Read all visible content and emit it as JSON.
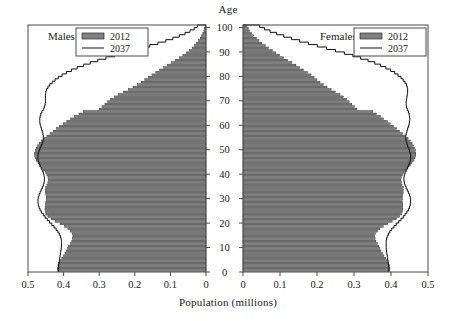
{
  "figure": {
    "age_axis_title": "Age",
    "x_axis_title": "Population (millions)",
    "background": "#ffffff",
    "frame_color": "#4a4a4a",
    "bar_fill": "#808080",
    "bar_edge": "#2b2b2b",
    "line_color": "#111111"
  },
  "panels": {
    "left": {
      "label": "Males",
      "legend": {
        "bar_label": "2012",
        "line_label": "2037"
      },
      "x_ticks": [
        "0.5",
        "0.4",
        "0.3",
        "0.2",
        "0.1",
        "0"
      ],
      "x_tick_values": [
        0.5,
        0.4,
        0.3,
        0.2,
        0.1,
        0.0
      ]
    },
    "right": {
      "label": "Females",
      "legend": {
        "bar_label": "2012",
        "line_label": "2037"
      },
      "x_ticks": [
        "0",
        "0.1",
        "0.2",
        "0.3",
        "0.4",
        "0.5"
      ],
      "x_tick_values": [
        0.0,
        0.1,
        0.2,
        0.3,
        0.4,
        0.5
      ]
    }
  },
  "age_ticks": [
    "0",
    "10",
    "20",
    "30",
    "40",
    "50",
    "60",
    "70",
    "80",
    "90",
    "100"
  ],
  "chart_data": {
    "type": "bar",
    "subtype": "population-pyramid",
    "title": "",
    "xlabel": "Population (millions)",
    "ylabel": "Age",
    "xlim": [
      0.5,
      0.5
    ],
    "ylim": [
      0,
      101
    ],
    "grid": false,
    "legend_position": "top-inside-both-panels",
    "age_groups": [
      0,
      1,
      2,
      3,
      4,
      5,
      6,
      7,
      8,
      9,
      10,
      11,
      12,
      13,
      14,
      15,
      16,
      17,
      18,
      19,
      20,
      21,
      22,
      23,
      24,
      25,
      26,
      27,
      28,
      29,
      30,
      31,
      32,
      33,
      34,
      35,
      36,
      37,
      38,
      39,
      40,
      41,
      42,
      43,
      44,
      45,
      46,
      47,
      48,
      49,
      50,
      51,
      52,
      53,
      54,
      55,
      56,
      57,
      58,
      59,
      60,
      61,
      62,
      63,
      64,
      65,
      66,
      67,
      68,
      69,
      70,
      71,
      72,
      73,
      74,
      75,
      76,
      77,
      78,
      79,
      80,
      81,
      82,
      83,
      84,
      85,
      86,
      87,
      88,
      89,
      90,
      91,
      92,
      93,
      94,
      95,
      96,
      97,
      98,
      99,
      100
    ],
    "series": [
      {
        "name": "Males 2012",
        "panel": "left",
        "render": "bar",
        "values": [
          0.417,
          0.417,
          0.416,
          0.414,
          0.411,
          0.405,
          0.4,
          0.396,
          0.392,
          0.389,
          0.386,
          0.381,
          0.377,
          0.375,
          0.374,
          0.376,
          0.381,
          0.388,
          0.397,
          0.41,
          0.423,
          0.435,
          0.444,
          0.45,
          0.452,
          0.452,
          0.452,
          0.451,
          0.45,
          0.449,
          0.449,
          0.45,
          0.451,
          0.452,
          0.45,
          0.447,
          0.444,
          0.443,
          0.444,
          0.447,
          0.451,
          0.456,
          0.461,
          0.467,
          0.472,
          0.477,
          0.48,
          0.481,
          0.481,
          0.479,
          0.477,
          0.473,
          0.468,
          0.462,
          0.455,
          0.447,
          0.438,
          0.429,
          0.42,
          0.411,
          0.401,
          0.391,
          0.38,
          0.369,
          0.357,
          0.345,
          0.3,
          0.292,
          0.284,
          0.276,
          0.268,
          0.258,
          0.246,
          0.232,
          0.218,
          0.205,
          0.193,
          0.182,
          0.172,
          0.162,
          0.152,
          0.141,
          0.13,
          0.119,
          0.108,
          0.097,
          0.086,
          0.075,
          0.065,
          0.056,
          0.047,
          0.039,
          0.032,
          0.026,
          0.021,
          0.016,
          0.012,
          0.009,
          0.006,
          0.004,
          0.003
        ]
      },
      {
        "name": "Males 2037",
        "panel": "left",
        "render": "line",
        "values": [
          0.414,
          0.414,
          0.414,
          0.413,
          0.412,
          0.411,
          0.41,
          0.409,
          0.408,
          0.407,
          0.406,
          0.406,
          0.406,
          0.407,
          0.409,
          0.412,
          0.416,
          0.421,
          0.427,
          0.433,
          0.44,
          0.446,
          0.452,
          0.457,
          0.462,
          0.466,
          0.469,
          0.471,
          0.472,
          0.472,
          0.471,
          0.469,
          0.466,
          0.463,
          0.46,
          0.457,
          0.455,
          0.454,
          0.454,
          0.455,
          0.457,
          0.46,
          0.463,
          0.466,
          0.469,
          0.471,
          0.472,
          0.472,
          0.471,
          0.469,
          0.466,
          0.463,
          0.46,
          0.458,
          0.457,
          0.457,
          0.458,
          0.46,
          0.462,
          0.464,
          0.466,
          0.467,
          0.467,
          0.466,
          0.464,
          0.461,
          0.457,
          0.454,
          0.452,
          0.451,
          0.451,
          0.451,
          0.451,
          0.45,
          0.448,
          0.444,
          0.439,
          0.432,
          0.424,
          0.415,
          0.404,
          0.392,
          0.378,
          0.362,
          0.344,
          0.325,
          0.304,
          0.281,
          0.257,
          0.232,
          0.207,
          0.182,
          0.158,
          0.135,
          0.113,
          0.093,
          0.075,
          0.059,
          0.045,
          0.033,
          0.024
        ]
      },
      {
        "name": "Females 2012",
        "panel": "right",
        "render": "bar",
        "values": [
          0.397,
          0.397,
          0.396,
          0.394,
          0.391,
          0.386,
          0.381,
          0.377,
          0.373,
          0.37,
          0.367,
          0.363,
          0.359,
          0.357,
          0.356,
          0.358,
          0.363,
          0.37,
          0.379,
          0.391,
          0.403,
          0.414,
          0.423,
          0.429,
          0.431,
          0.432,
          0.432,
          0.432,
          0.431,
          0.431,
          0.431,
          0.432,
          0.433,
          0.434,
          0.433,
          0.43,
          0.428,
          0.427,
          0.428,
          0.431,
          0.435,
          0.44,
          0.446,
          0.452,
          0.457,
          0.462,
          0.465,
          0.467,
          0.467,
          0.466,
          0.464,
          0.461,
          0.457,
          0.452,
          0.446,
          0.439,
          0.431,
          0.423,
          0.415,
          0.407,
          0.398,
          0.39,
          0.38,
          0.371,
          0.361,
          0.351,
          0.308,
          0.301,
          0.294,
          0.287,
          0.28,
          0.272,
          0.262,
          0.25,
          0.238,
          0.227,
          0.217,
          0.208,
          0.2,
          0.192,
          0.184,
          0.174,
          0.164,
          0.153,
          0.143,
          0.132,
          0.121,
          0.11,
          0.099,
          0.089,
          0.079,
          0.069,
          0.06,
          0.051,
          0.043,
          0.036,
          0.029,
          0.023,
          0.018,
          0.014,
          0.011
        ]
      },
      {
        "name": "Females 2037",
        "panel": "right",
        "render": "line",
        "values": [
          0.394,
          0.394,
          0.394,
          0.393,
          0.392,
          0.391,
          0.39,
          0.389,
          0.388,
          0.387,
          0.387,
          0.387,
          0.387,
          0.388,
          0.39,
          0.393,
          0.397,
          0.402,
          0.408,
          0.414,
          0.421,
          0.427,
          0.433,
          0.438,
          0.443,
          0.447,
          0.45,
          0.452,
          0.453,
          0.453,
          0.452,
          0.45,
          0.447,
          0.444,
          0.441,
          0.438,
          0.436,
          0.435,
          0.435,
          0.436,
          0.438,
          0.441,
          0.444,
          0.447,
          0.45,
          0.452,
          0.453,
          0.453,
          0.452,
          0.45,
          0.448,
          0.445,
          0.443,
          0.441,
          0.44,
          0.44,
          0.441,
          0.443,
          0.445,
          0.447,
          0.449,
          0.45,
          0.451,
          0.45,
          0.449,
          0.447,
          0.444,
          0.442,
          0.441,
          0.441,
          0.442,
          0.443,
          0.444,
          0.445,
          0.445,
          0.444,
          0.442,
          0.438,
          0.433,
          0.427,
          0.419,
          0.41,
          0.399,
          0.386,
          0.372,
          0.356,
          0.338,
          0.318,
          0.297,
          0.274,
          0.25,
          0.226,
          0.201,
          0.177,
          0.153,
          0.131,
          0.11,
          0.091,
          0.073,
          0.058,
          0.045
        ]
      }
    ]
  }
}
